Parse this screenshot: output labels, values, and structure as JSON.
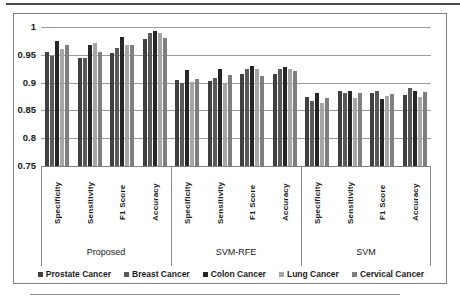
{
  "chart_data": {
    "type": "bar",
    "title": "",
    "xlabel": "",
    "ylabel": "",
    "ylim": [
      0.75,
      1.0
    ],
    "grid": true,
    "legend_position": "bottom",
    "yticks": [
      {
        "label": "1",
        "value": 1.0
      },
      {
        "label": "0.95",
        "value": 0.95
      },
      {
        "label": "0.9",
        "value": 0.9
      },
      {
        "label": "0.85",
        "value": 0.85
      },
      {
        "label": "0.8",
        "value": 0.8
      },
      {
        "label": "0.75",
        "value": 0.75
      }
    ],
    "groups": [
      "Proposed",
      "SVM-RFE",
      "SVM"
    ],
    "metrics": [
      "Specificity",
      "Sensitivity",
      "F1 Score",
      "Accuracy"
    ],
    "series": [
      {
        "name": "Prostate Cancer",
        "color": "#404040",
        "values": [
          0.955,
          0.945,
          0.953,
          0.978,
          0.905,
          0.903,
          0.916,
          0.915,
          0.875,
          0.885,
          0.882,
          0.878
        ]
      },
      {
        "name": "Breast Cancer",
        "color": "#595959",
        "values": [
          0.947,
          0.945,
          0.963,
          0.99,
          0.9,
          0.908,
          0.924,
          0.925,
          0.867,
          0.881,
          0.885,
          0.891
        ]
      },
      {
        "name": "Colon Cancer",
        "color": "#262626",
        "values": [
          0.975,
          0.968,
          0.982,
          0.993,
          0.922,
          0.925,
          0.93,
          0.928,
          0.882,
          0.885,
          0.87,
          0.885
        ]
      },
      {
        "name": "Lung Cancer",
        "color": "#a6a6a6",
        "values": [
          0.96,
          0.972,
          0.968,
          0.99,
          0.901,
          0.9,
          0.924,
          0.925,
          0.864,
          0.873,
          0.876,
          0.875
        ]
      },
      {
        "name": "Cervical Cancer",
        "color": "#7f7f7f",
        "values": [
          0.968,
          0.955,
          0.968,
          0.98,
          0.906,
          0.913,
          0.912,
          0.921,
          0.873,
          0.882,
          0.879,
          0.884
        ]
      }
    ]
  }
}
